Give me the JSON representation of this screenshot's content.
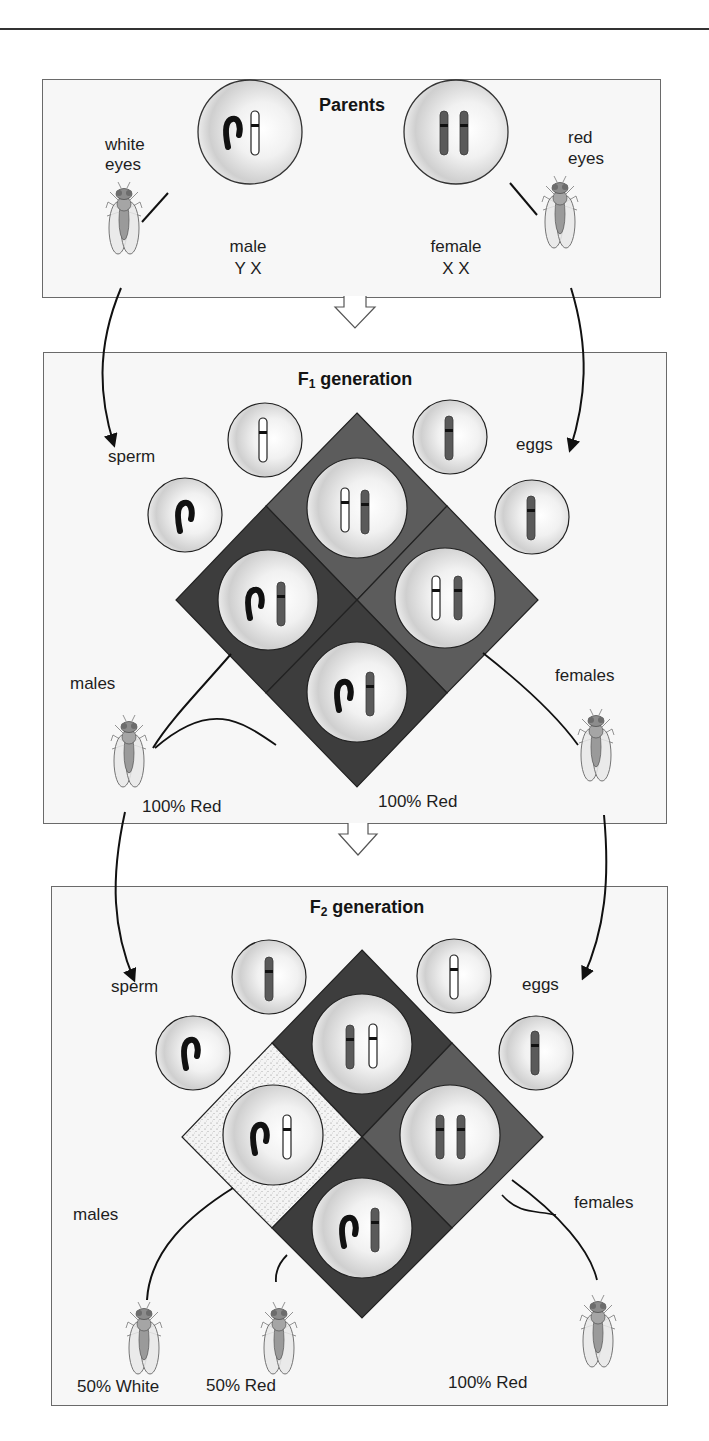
{
  "figure": {
    "top_rule": true,
    "colors": {
      "panel_bg": "#f7f7f7",
      "panel_border": "#6a6a6a",
      "square_dark": "#3d3d3d",
      "square_medium": "#5c5c5c",
      "square_stipple": "#f2f2f2",
      "chromosome_y": "#1c1c1c",
      "chromosome_red_x": "#5a5a5a",
      "chromosome_white_x": "#ffffff"
    }
  },
  "parents": {
    "title": "Parents",
    "male_fly_label_line1": "white",
    "male_fly_label_line2": "eyes",
    "female_fly_label_line1": "red",
    "female_fly_label_line2": "eyes",
    "male_cell_label": "male",
    "male_genotype": "Y X",
    "female_cell_label": "female",
    "female_genotype": "X X",
    "male_cell_chromosomes": [
      "Y",
      "X-white"
    ],
    "female_cell_chromosomes": [
      "X-red",
      "X-red"
    ]
  },
  "f1": {
    "title_prefix": "F",
    "title_sub": "1",
    "title_suffix": " generation",
    "sperm_label": "sperm",
    "eggs_label": "eggs",
    "males_label": "males",
    "females_label": "females",
    "males_result": "100% Red",
    "females_result": "100% Red",
    "sperm": [
      "X-white",
      "Y"
    ],
    "eggs": [
      "X-red",
      "X-red"
    ],
    "punnett": {
      "top": [
        "X-white",
        "X-red"
      ],
      "right": [
        "X-white",
        "X-red"
      ],
      "left": [
        "Y",
        "X-red"
      ],
      "bottom": [
        "Y",
        "X-red"
      ]
    }
  },
  "f2": {
    "title_prefix": "F",
    "title_sub": "2",
    "title_suffix": " generation",
    "sperm_label": "sperm",
    "eggs_label": "eggs",
    "males_label": "males",
    "females_label": "females",
    "male_white_result": "50% White",
    "male_red_result": "50% Red",
    "females_result": "100% Red",
    "sperm": [
      "X-red",
      "Y"
    ],
    "eggs": [
      "X-white",
      "X-red"
    ],
    "punnett": {
      "top": [
        "X-red",
        "X-white"
      ],
      "right": [
        "X-red",
        "X-red"
      ],
      "left": [
        "Y",
        "X-white"
      ],
      "bottom": [
        "Y",
        "X-red"
      ]
    }
  }
}
